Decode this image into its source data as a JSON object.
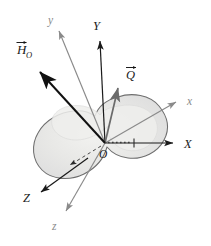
{
  "figure": {
    "type": "vector-diagram",
    "background_color": "#ffffff",
    "body": {
      "name": "rigid-body",
      "shape": "irregular blob / amoeba outline with two lobes",
      "fill_color": "#e3e3e1",
      "inner_fill_color": "#ececea",
      "outline_color": "#6e6e6e"
    },
    "colors": {
      "fixed_axes": "#1a1a1a",
      "rotating_axes": "#8a8a8a",
      "vector_H": "#111111",
      "vector_Q": "#6b6b6b",
      "hidden_line": "#4a4a4a",
      "projection_line": "#3a3a3a"
    },
    "origin": {
      "label": "O",
      "name": "origin-point",
      "x": 105,
      "y": 143
    },
    "axes": [
      {
        "name": "axis-X",
        "label": "X",
        "frame": "fixed",
        "style": "solid",
        "color": "#1a1a1a",
        "label_x": 186,
        "label_y": 148,
        "from": [
          105,
          143
        ],
        "to": [
          175,
          143
        ]
      },
      {
        "name": "axis-Y",
        "label": "Y",
        "frame": "fixed",
        "style": "solid",
        "color": "#1a1a1a",
        "label_x": 96,
        "label_y": 29,
        "from": [
          105,
          143
        ],
        "to": [
          100,
          38
        ]
      },
      {
        "name": "axis-Z",
        "label": "Z",
        "frame": "fixed",
        "style": "solid with hidden dashed segment",
        "color": "#1a1a1a",
        "label_x": 26,
        "label_y": 200,
        "from": [
          105,
          143
        ],
        "to": [
          40,
          194
        ]
      },
      {
        "name": "axis-x-rotating",
        "label": "x",
        "frame": "rotating",
        "style": "solid",
        "color": "#8a8a8a",
        "label_x": 190,
        "label_y": 105,
        "from": [
          105,
          143
        ],
        "to": [
          180,
          100
        ]
      },
      {
        "name": "axis-y-rotating",
        "label": "y",
        "frame": "rotating",
        "style": "solid",
        "color": "#8a8a8a",
        "label_x": 50,
        "label_y": 22,
        "from": [
          105,
          143
        ],
        "to": [
          57,
          26
        ]
      },
      {
        "name": "axis-z-rotating",
        "label": "z",
        "frame": "rotating",
        "style": "solid",
        "color": "#8a8a8a",
        "label_x": 54,
        "label_y": 228,
        "from": [
          105,
          143
        ],
        "to": [
          63,
          215
        ]
      }
    ],
    "vectors": [
      {
        "name": "vector-H-O",
        "label": "H",
        "subscript": "O",
        "overbar": "arrow",
        "color": "#111111",
        "label_x": 19,
        "label_y": 52,
        "from": [
          105,
          143
        ],
        "to": [
          38,
          70
        ]
      },
      {
        "name": "vector-Q",
        "label": "Q",
        "subscript": "",
        "overbar": "arrow",
        "color": "#6b6b6b",
        "label_x": 129,
        "label_y": 76,
        "from": [
          105,
          143
        ],
        "to": [
          119,
          89
        ]
      }
    ],
    "annotations": [
      {
        "name": "projection-dotted-line",
        "description": "dotted horizontal segment from O to tick on X axis",
        "style": "dotted",
        "from": [
          107,
          143
        ],
        "to": [
          133,
          143
        ]
      },
      {
        "name": "x-axis-tick",
        "description": "short vertical tick mark on X axis",
        "x": 134,
        "y": 143
      },
      {
        "name": "hidden-dashed-segment",
        "description": "dashed portion of Z axis inside the body",
        "style": "dashed",
        "from": [
          101,
          146
        ],
        "to": [
          67,
          166
        ]
      }
    ]
  }
}
